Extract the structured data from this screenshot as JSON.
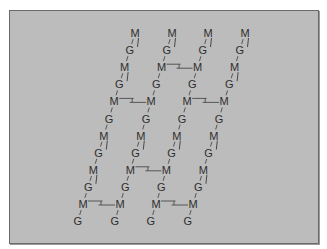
{
  "diagram": {
    "title": "",
    "background_color": "#bcbcbc",
    "border_color": "#6a6a6a",
    "text_color": "#2e2e2e",
    "layout": {
      "top_x": [
        135,
        172,
        208,
        245
      ],
      "top_y": 33,
      "row_dx": -5.2,
      "row_dy": 17.1
    },
    "labels": {
      "M": "M",
      "G": "G"
    },
    "strands": [
      {
        "id": "strand-1",
        "sequence": [
          "M",
          "G",
          "M",
          "G",
          "M",
          "G",
          "M",
          "G",
          "M",
          "G",
          "M",
          "G"
        ]
      },
      {
        "id": "strand-2",
        "sequence": [
          "M",
          "G",
          "M",
          "G",
          "M",
          "G",
          "M",
          "G",
          "M",
          "G",
          "M",
          "G"
        ]
      },
      {
        "id": "strand-3",
        "sequence": [
          "M",
          "G",
          "M",
          "G",
          "M",
          "G",
          "M",
          "G",
          "M",
          "G",
          "M",
          "G"
        ]
      },
      {
        "id": "strand-4",
        "sequence": [
          "M",
          "G",
          "M",
          "G",
          "M",
          "G",
          "M",
          "G",
          "M",
          "G",
          "M",
          "G"
        ]
      }
    ],
    "cross_links": [
      {
        "row": 2,
        "from_strand": 1,
        "to_strand": 2
      },
      {
        "row": 4,
        "from_strand": 0,
        "to_strand": 1
      },
      {
        "row": 4,
        "from_strand": 2,
        "to_strand": 3
      },
      {
        "row": 8,
        "from_strand": 1,
        "to_strand": 2
      },
      {
        "row": 10,
        "from_strand": 0,
        "to_strand": 1
      },
      {
        "row": 10,
        "from_strand": 2,
        "to_strand": 3
      }
    ],
    "stubs": [
      {
        "strand": 0,
        "rows": [
          0,
          2,
          6,
          8
        ]
      },
      {
        "strand": 1,
        "rows": [
          0,
          6
        ]
      },
      {
        "strand": 2,
        "rows": [
          0,
          6
        ]
      },
      {
        "strand": 3,
        "rows": [
          0,
          2,
          6,
          8
        ]
      }
    ]
  }
}
